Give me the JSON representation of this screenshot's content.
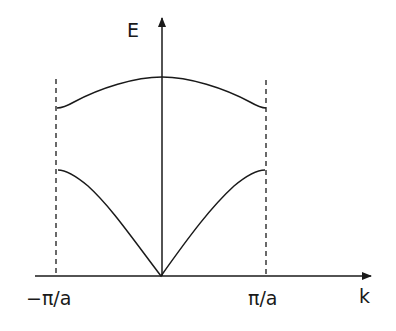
{
  "diagram": {
    "axes": {
      "y_label": "E",
      "x_label": "k"
    },
    "tick_labels": {
      "left": "−π/a",
      "right": "π/a"
    },
    "branches": [
      {
        "name": "acoustic",
        "shape": "V-shaped from origin, flattening to zone boundary"
      },
      {
        "name": "optical",
        "shape": "maximum at k=0, decreasing toward zone boundary"
      }
    ],
    "zone_boundaries": [
      "−π/a",
      "π/a"
    ],
    "colors": {
      "line": "#1a1a1a",
      "background": "#ffffff"
    }
  }
}
